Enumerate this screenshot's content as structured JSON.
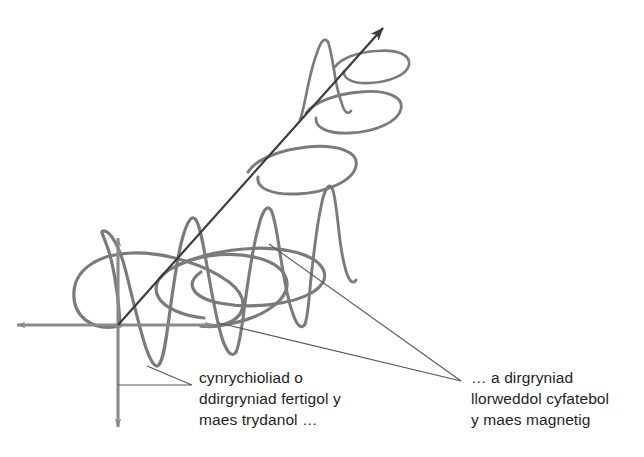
{
  "figure": {
    "background_color": "#ffffff",
    "width": 644,
    "height": 457
  },
  "colors": {
    "wave": "#7b7b7b",
    "axis": "#8a8a8a",
    "propagation_arrow": "#3b3b3b",
    "leader_line": "#58585a",
    "text": "#231f20"
  },
  "captions": {
    "electric": {
      "name": "electric-field-caption",
      "lines": [
        "cynrychioliad o",
        "ddirgryniad fertigol y",
        "maes trydanol …"
      ]
    },
    "magnetic": {
      "name": "magnetic-field-caption",
      "lines": [
        "… a dirgryniad",
        "llorweddol cyfatebol",
        "y maes magnetig"
      ]
    }
  },
  "elements": {
    "propagation_arrow_label": "direction-of-propagation",
    "vertical_axis_label": "vertical-axis",
    "horizontal_axis_label": "horizontal-axis",
    "electric_wave_label": "electric-field-wave",
    "magnetic_wave_label": "magnetic-field-wave"
  },
  "geometry": {
    "origin": [
      118,
      325
    ],
    "propagation_tip": [
      390,
      20
    ],
    "vertical_axis_top": [
      118,
      233
    ],
    "vertical_axis_bottom": [
      118,
      432
    ],
    "horizontal_axis_left": [
      12,
      325
    ],
    "horizontal_axis_right": [
      218,
      325
    ],
    "leader_convergence": [
      463,
      382
    ],
    "leader_electric_elbow": [
      192,
      385
    ]
  }
}
